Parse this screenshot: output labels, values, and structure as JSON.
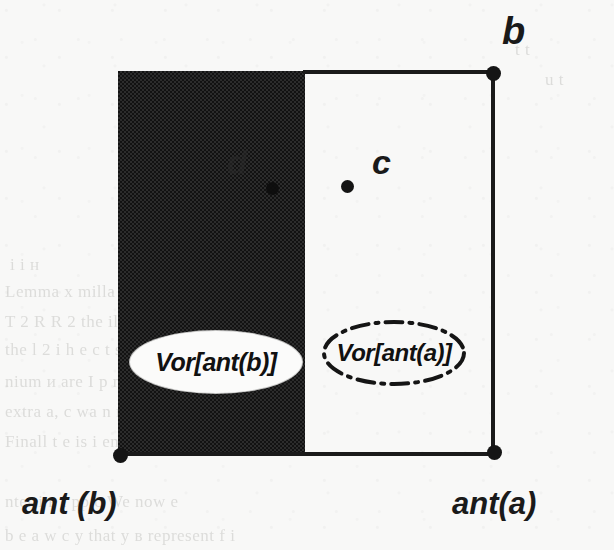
{
  "figure": {
    "type": "voronoi-diagram-illustration",
    "labels": {
      "vertex_b": "b",
      "vertex_ant_a": "ant(a)",
      "vertex_ant_b": "ant (b)",
      "site_c": "c",
      "site_d": "d",
      "region_shaded": "Vor[ant(b)]",
      "region_white": "Vor[ant(a)]"
    },
    "colors": {
      "paper": "#f8f8f7",
      "ink": "#1a1a1a",
      "shaded_fill": "#1b1b1b",
      "white_fill": "#fbfbfa"
    },
    "regions": [
      {
        "name": "Vor[ant(b)]",
        "fill": "shaded",
        "outline": "none"
      },
      {
        "name": "Vor[ant(a)]",
        "fill": "white",
        "outline": "dash-dot"
      }
    ]
  },
  "background_ghost_text": [
    {
      "text": "t  t",
      "x": 515,
      "y": 40
    },
    {
      "text": "u t",
      "x": 545,
      "y": 70
    },
    {
      "text": "i  i  н",
      "x": 10,
      "y": 255
    },
    {
      "text": "Lemma  x   milla ,    Sinom  ,  С ahin  x  Vor",
      "x": 5,
      "y": 282
    },
    {
      "text": "T 2 R  R 2  the  ilia her      ат  и  n  i  e   t  m  и  т  r ",
      "x": 5,
      "y": 312
    },
    {
      "text": "the  l 2   i    h  e   c   t     s   e  n  tr  i",
      "x": 5,
      "y": 340
    },
    {
      "text": "nium   и are  I  p  n  S  e  a  nu   l   i    a  n  t",
      "x": 5,
      "y": 372
    },
    {
      "text": "extra   a, c  wa  n  r     t   n  h   o  f  p    i",
      "x": 5,
      "y": 402
    },
    {
      "text": "Finall    t   e  is   i  en    a   y  t   b     r   c    i",
      "x": 5,
      "y": 432
    },
    {
      "text": "nter  i  в  t   рр  с   We  now  e",
      "x": 5,
      "y": 492
    },
    {
      "text": "b    e   а   w  с    у   that  у  в represent   f   i",
      "x": 5,
      "y": 526
    }
  ]
}
